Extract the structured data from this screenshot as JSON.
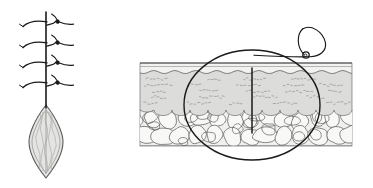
{
  "figure": {
    "background_color": "#ffffff",
    "width": 373,
    "height": 188,
    "panels": [
      {
        "id": "panel-left",
        "name": "sutured-wound-top-view",
        "caption": "",
        "description": "Top-down view of a closed surgical wound with interrupted sutures and a lenticular (elliptical) excision defect"
      },
      {
        "id": "panel-right",
        "name": "skin-cross-section",
        "caption": "",
        "description": "Cross-sectional view of skin layers with magnification ellipse, vertical incision and suture loop with knot"
      }
    ]
  },
  "colors": {
    "ink": "#1a1a1a",
    "stroke_mid": "#4a4a4a",
    "stroke_light": "#8c8c8c",
    "epidermis_fill": "#f2f2f0",
    "dermis_fill": "#dcdcda",
    "dermis_texture": "#9a9a98",
    "fat_fill": "#f0f0ee",
    "fat_stroke": "#5c5c5c",
    "wound_fill": "#e4e4e2",
    "wound_stroke": "#5a5a5a",
    "wound_texture": "#a8a8a6",
    "background": "#ffffff"
  },
  "left_panel": {
    "name": "sutured-wound-top-view",
    "suture_line": {
      "name": "running-suture-line",
      "x": 46,
      "y_top": 12,
      "y_bottom": 108,
      "stroke": "#1a1a1a",
      "width": 1.6
    },
    "stitches": [
      {
        "index": 1,
        "name": "interrupted-stitch-1",
        "y": 23,
        "knot_x": 57,
        "knot_y": 21
      },
      {
        "index": 2,
        "name": "interrupted-stitch-2",
        "y": 44,
        "knot_x": 57,
        "knot_y": 42
      },
      {
        "index": 3,
        "name": "interrupted-stitch-3",
        "y": 64,
        "knot_x": 57,
        "knot_y": 62
      },
      {
        "index": 4,
        "name": "interrupted-stitch-4",
        "y": 84,
        "knot_x": 57,
        "knot_y": 82
      }
    ],
    "stitch_count": 4,
    "wound": {
      "name": "lenticular-wound-defect",
      "center_x": 46,
      "top_y": 105,
      "bottom_y": 178,
      "half_width": 17,
      "fill": "#e4e4e2",
      "stroke": "#5a5a5a",
      "inner_striation_count": 5
    }
  },
  "right_panel": {
    "name": "skin-cross-section",
    "tissue_block": {
      "name": "tissue-block",
      "x_left": 140,
      "x_right": 352,
      "y_top": 63,
      "y_bottom": 146
    },
    "layers": [
      {
        "index": 0,
        "name": "epidermis-layer",
        "label": "epidermis",
        "y_top": 63,
        "y_bottom": 72,
        "fill": "#f2f2f0"
      },
      {
        "index": 1,
        "name": "dermis-layer",
        "label": "dermis",
        "y_top": 72,
        "y_bottom": 110,
        "fill": "#dcdcda",
        "texture": "dashed-collagen-marks"
      },
      {
        "index": 2,
        "name": "subcutaneous-fat-layer",
        "label": "subcutaneous fat",
        "y_top": 110,
        "y_bottom": 146,
        "fill": "#f0f0ee",
        "texture": "fat-lobules",
        "lobule_rows": 2
      }
    ],
    "magnifier_ellipse": {
      "name": "magnification-ellipse",
      "center_x": 252,
      "center_y": 105,
      "radius_x": 68,
      "radius_y": 55,
      "stroke": "#1a1a1a",
      "width": 1.4
    },
    "incision": {
      "name": "vertical-incision-line",
      "x": 252,
      "y_top": 68,
      "y_bottom": 133,
      "stroke": "#1a1a1a",
      "width": 1.5
    },
    "suture_loop": {
      "name": "suture-thread-loop",
      "knot": {
        "name": "suture-knot",
        "cx": 306,
        "cy": 55,
        "r": 3.2
      },
      "stroke": "#1a1a1a",
      "width": 1.2
    }
  }
}
